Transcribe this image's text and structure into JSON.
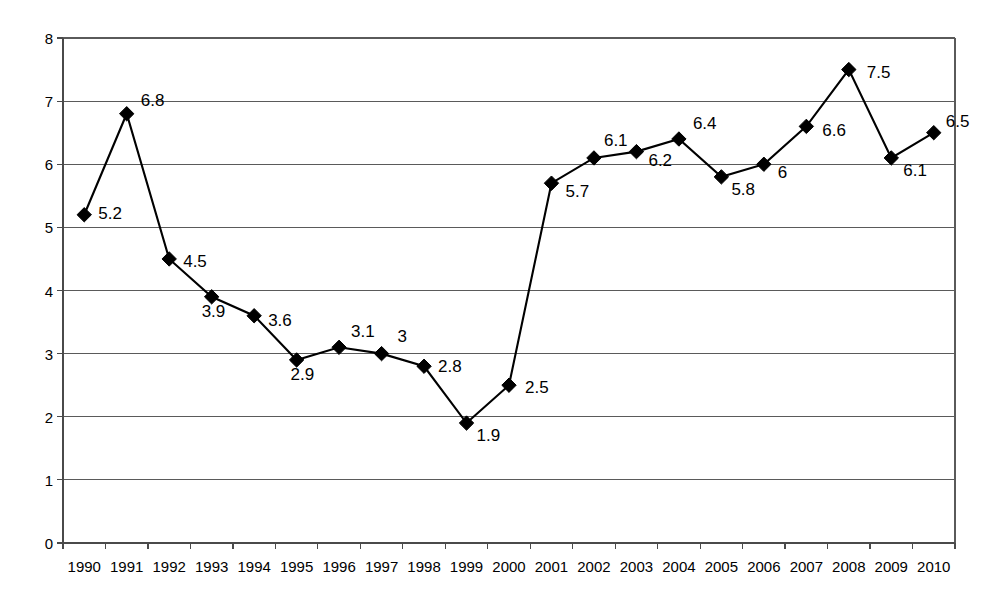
{
  "chart_data": {
    "type": "line",
    "title": "",
    "subtitle": "",
    "xlabel": "",
    "ylabel": "",
    "categories": [
      "1990",
      "1991",
      "1992",
      "1993",
      "1994",
      "1995",
      "1996",
      "1997",
      "1998",
      "1999",
      "2000",
      "2001",
      "2002",
      "2003",
      "2004",
      "2005",
      "2006",
      "2007",
      "2008",
      "2009",
      "2010"
    ],
    "values": [
      5.2,
      6.8,
      4.5,
      3.9,
      3.6,
      2.9,
      3.1,
      3,
      2.8,
      1.9,
      2.5,
      5.7,
      6.1,
      6.2,
      6.4,
      5.8,
      6,
      6.6,
      7.5,
      6.1,
      6.5
    ],
    "point_labels": [
      "5.2",
      "6.8",
      "4.5",
      "3.9",
      "3.6",
      "2.9",
      "3.1",
      "3",
      "2.8",
      "1.9",
      "2.5",
      "5.7",
      "6.1",
      "6.2",
      "6.4",
      "5.8",
      "6",
      "6.6",
      "7.5",
      "6.1",
      "6.5"
    ],
    "ylim": [
      0,
      8
    ],
    "ytick_values": [
      8,
      7,
      6,
      5,
      4,
      3,
      2,
      1,
      0
    ],
    "ytick_labels": [
      "8",
      "7",
      "6",
      "5",
      "4",
      "3",
      "2",
      "1",
      "0"
    ],
    "grid": true,
    "grid_axis": "y",
    "legend": false,
    "legend_position": "none",
    "marker": "diamond",
    "data_labels_shown": true,
    "colors": {
      "line": "#000000",
      "marker": "#000000",
      "grid": "#5a5a5a",
      "axis": "#4a4a4a",
      "background": "#ffffff",
      "text": "#000000"
    },
    "label_offsets": [
      {
        "dx": 14,
        "dy": -8
      },
      {
        "dx": 14,
        "dy": -20
      },
      {
        "dx": 14,
        "dy": -4
      },
      {
        "dx": -10,
        "dy": 8
      },
      {
        "dx": 14,
        "dy": -2
      },
      {
        "dx": -6,
        "dy": 8
      },
      {
        "dx": 12,
        "dy": -22
      },
      {
        "dx": 16,
        "dy": -24
      },
      {
        "dx": 14,
        "dy": -6
      },
      {
        "dx": 10,
        "dy": 6
      },
      {
        "dx": 16,
        "dy": -4
      },
      {
        "dx": 14,
        "dy": 2
      },
      {
        "dx": 10,
        "dy": -24
      },
      {
        "dx": 12,
        "dy": 2
      },
      {
        "dx": 14,
        "dy": -22
      },
      {
        "dx": 10,
        "dy": 6
      },
      {
        "dx": 14,
        "dy": 2
      },
      {
        "dx": 16,
        "dy": -2
      },
      {
        "dx": 18,
        "dy": -4
      },
      {
        "dx": 12,
        "dy": 6
      },
      {
        "dx": 12,
        "dy": -18
      }
    ]
  }
}
